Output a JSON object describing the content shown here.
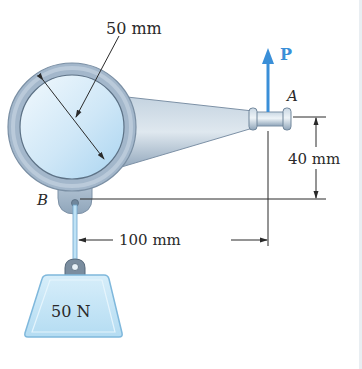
{
  "diagram": {
    "type": "engineering-statics-figure",
    "labels": {
      "diameter": "50 mm",
      "force": "P",
      "point_a": "A",
      "point_b": "B",
      "vertical_offset": "40 mm",
      "horizontal_offset": "100 mm",
      "weight": "50 N"
    },
    "colors": {
      "ring": "#9fb3c8",
      "ring_inner": "#cfe6f7",
      "arm": "#a8bccf",
      "force_arrow": "#3a8fd8",
      "weight_fill": "#bfe3f6",
      "weight_stroke": "#7fb8dc",
      "dimension_lines": "#2a2a2a",
      "text": "#2a2a2a"
    }
  }
}
